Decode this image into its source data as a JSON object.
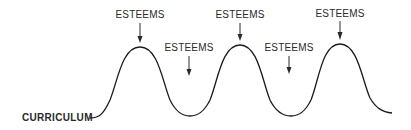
{
  "diagram": {
    "baseline_label": "CURRICULUM",
    "peak_labels": [
      {
        "text": "ESTEEMS",
        "position": "peak-1"
      },
      {
        "text": "ESTEEMS",
        "position": "peak-2"
      },
      {
        "text": "ESTEEMS",
        "position": "peak-3"
      }
    ],
    "trough_labels": [
      {
        "text": "ESTEEMS",
        "position": "trough-1"
      },
      {
        "text": "ESTEEMS",
        "position": "trough-2"
      }
    ],
    "colors": {
      "line": "#1a1a1a",
      "text": "#2a2a2a",
      "background": "#ffffff"
    }
  }
}
